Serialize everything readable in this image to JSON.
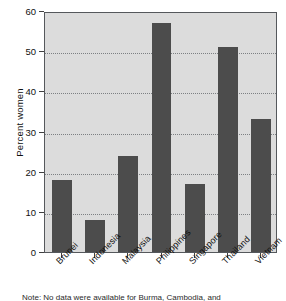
{
  "chart_data": {
    "type": "bar",
    "title": "",
    "subtitle": "",
    "xlabel": "",
    "ylabel": "Percent women",
    "categories": [
      "Brunei",
      "Indonesia",
      "Malaysia",
      "Philippines",
      "Singapore",
      "Thailand",
      "Vietnam"
    ],
    "values": [
      18,
      8,
      24,
      57,
      17,
      51,
      33
    ],
    "series": [
      {
        "name": "Percent women",
        "values": [
          18,
          8,
          24,
          57,
          17,
          51,
          33
        ]
      }
    ],
    "ylim": [
      0,
      60
    ],
    "ytick_values": [
      0,
      10,
      20,
      30,
      40,
      50,
      60
    ],
    "ytick_labels": [
      "0",
      "10",
      "20",
      "30",
      "40",
      "50",
      "60"
    ],
    "grid": true,
    "grid_axis": "y",
    "grid_style": "dotted",
    "legend": false,
    "legend_position": "none",
    "bar_color": "#4c4c4c",
    "plot_background_color": "#dcdcdc",
    "figure_background_color": "#ffffff",
    "axis_color": "#55585c",
    "xtick_label_rotation": -45,
    "annotations": []
  },
  "figure": {
    "note": "Note: No data were available for Burma, Cambodia, and"
  }
}
